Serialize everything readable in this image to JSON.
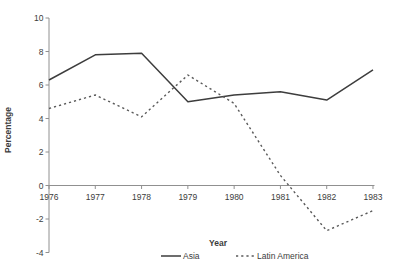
{
  "chart_data": {
    "type": "line",
    "title": "",
    "xlabel": "Year",
    "ylabel": "Percentage",
    "x": [
      1976,
      1977,
      1978,
      1979,
      1980,
      1981,
      1982,
      1983
    ],
    "x_tick_labels": [
      "1976",
      "1977",
      "1978",
      "1979",
      "1980",
      "1981",
      "1982",
      "1983"
    ],
    "y_ticks": [
      10,
      8,
      6,
      4,
      2,
      0,
      -2,
      -4
    ],
    "y_tick_labels": [
      "10",
      "8",
      "6",
      "4",
      "2",
      "0",
      "-2",
      "-4"
    ],
    "ylim": [
      -4,
      10
    ],
    "grid": false,
    "legend_position": "bottom-center",
    "series": [
      {
        "name": "Asia",
        "line_style": "solid",
        "color": "#3d3d3d",
        "values": [
          6.3,
          7.8,
          7.9,
          5.0,
          5.4,
          5.6,
          5.1,
          6.9
        ]
      },
      {
        "name": "Latin America",
        "line_style": "dashed",
        "color": "#5a5a5a",
        "values": [
          4.6,
          5.4,
          4.1,
          6.6,
          4.9,
          0.6,
          -2.7,
          -1.5
        ]
      }
    ],
    "colors": {
      "axis": "#909090",
      "text": "#3c3c3c",
      "background": "#ffffff"
    }
  }
}
